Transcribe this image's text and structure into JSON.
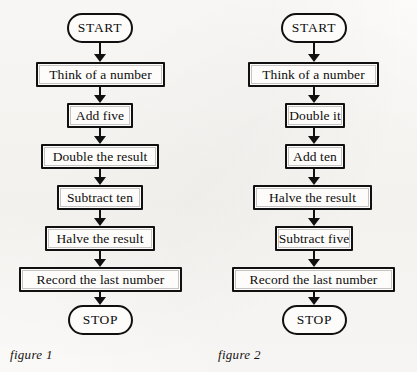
{
  "page": {
    "background_color": "#fbfaf8",
    "ink_color": "#101010",
    "type": "scanned-textbook-flowchart-page"
  },
  "figures": [
    {
      "id": "figure-1",
      "caption": "figure 1",
      "nodes": [
        {
          "shape": "terminal",
          "label": "START"
        },
        {
          "shape": "process",
          "label": "Think of a number"
        },
        {
          "shape": "process",
          "label": "Add five"
        },
        {
          "shape": "process",
          "label": "Double the result"
        },
        {
          "shape": "process",
          "label": "Subtract ten"
        },
        {
          "shape": "process",
          "label": "Halve the result"
        },
        {
          "shape": "process",
          "label": "Record the last number"
        },
        {
          "shape": "terminal",
          "label": "STOP"
        }
      ]
    },
    {
      "id": "figure-2",
      "caption": "figure 2",
      "nodes": [
        {
          "shape": "terminal",
          "label": "START"
        },
        {
          "shape": "process",
          "label": "Think of a number"
        },
        {
          "shape": "process",
          "label": "Double it"
        },
        {
          "shape": "process",
          "label": "Add ten"
        },
        {
          "shape": "process",
          "label": "Halve the result"
        },
        {
          "shape": "process",
          "label": "Subtract five"
        },
        {
          "shape": "process",
          "label": "Record the last number"
        },
        {
          "shape": "terminal",
          "label": "STOP"
        }
      ]
    }
  ]
}
